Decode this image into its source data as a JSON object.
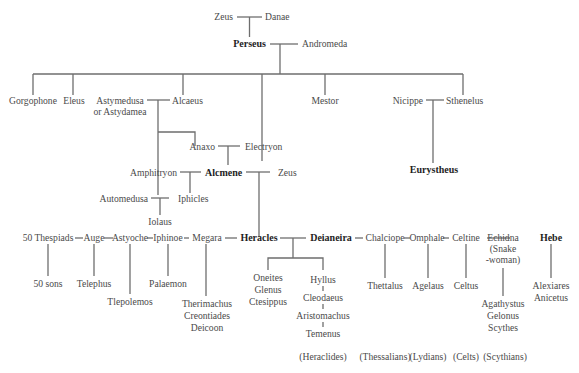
{
  "diagram": {
    "type": "family-tree",
    "line_color": "#6e6e6e",
    "text_color": "#4a4a4a",
    "emphasis_color": "#1e1e1e",
    "people": {
      "zeus_top": "Zeus",
      "danae": "Danae",
      "perseus": "Perseus",
      "andromeda": "Andromeda",
      "gorgophone": "Gorgophone",
      "eleus": "Eleus",
      "astymedusa_1": "Astymedusa",
      "astymedusa_2": "or Astydamea",
      "alcaeus": "Alcaeus",
      "mestor": "Mestor",
      "nicippe": "Nicippe",
      "sthenelus": "Sthenelus",
      "eurystheus": "Eurystheus",
      "anaxo": "Anaxo",
      "electryon": "Electryon",
      "amphitryon": "Amphitryon",
      "alcmene": "Alcmene",
      "zeus_mid": "Zeus",
      "automedusa": "Automedusa",
      "iphicles": "Iphicles",
      "iolaus": "Iolaus",
      "thespiads": "50 Thespiads",
      "auge": "Auge",
      "astyoche": "Astyoche",
      "iphinoe": "Iphinoe",
      "megara": "Megara",
      "heracles": "Heracles",
      "deianeira": "Deianeira",
      "chalciope": "Chalciope",
      "omphale": "Omphale",
      "celtine": "Celtine",
      "echidna_1": "Echidna",
      "echidna_2": "(Snake",
      "echidna_3": "-woman)",
      "hebe": "Hebe",
      "fifty_sons": "50 sons",
      "telephus": "Telephus",
      "tlepolemos": "Tlepolemos",
      "palaemon": "Palaemon",
      "megara_children": [
        "Therimachus",
        "Creontiades",
        "Deicoon"
      ],
      "deianeira_children_a": [
        "Oneites",
        "Glenus",
        "Ctesippus"
      ],
      "hyllus_line": [
        "Hyllus",
        "Cleodaeus",
        "Aristomachus",
        "Temenus"
      ],
      "thettalus": "Thettalus",
      "agelaus": "Agelaus",
      "celtus": "Celtus",
      "echidna_children": [
        "Agathystus",
        "Gelonus",
        "Scythes"
      ],
      "hebe_children": [
        "Alexiares",
        "Anicetus"
      ]
    },
    "peoples": {
      "heraclides": "(Heraclides)",
      "thessalians": "(Thessalians)",
      "lydians": "(Lydians)",
      "celts": "(Celts)",
      "scythians": "(Scythians)"
    },
    "emphasized": [
      "Perseus",
      "Alcmene",
      "Eurystheus",
      "Heracles",
      "Deianeira",
      "Hebe"
    ]
  }
}
